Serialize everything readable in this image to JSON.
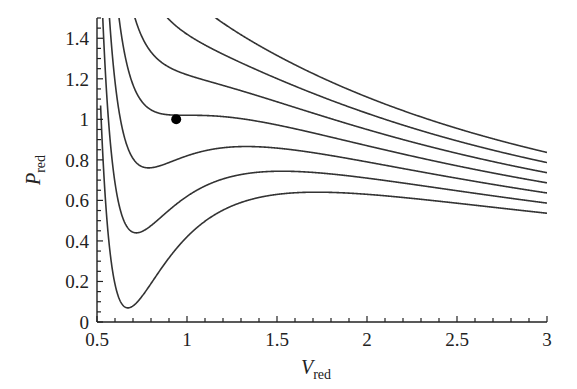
{
  "chart_data": {
    "type": "line",
    "title": "",
    "xlabel": "V",
    "xlabel_sub": "red",
    "ylabel": "P",
    "ylabel_sub": "red",
    "xlim": [
      0.5,
      3
    ],
    "ylim": [
      0,
      1.5
    ],
    "x_ticks": [
      0.5,
      1,
      1.5,
      2,
      2.5,
      3
    ],
    "x_tick_labels": [
      "0.5",
      "1",
      "1.5",
      "2",
      "2.5",
      "3"
    ],
    "x_minor_step": 0.1,
    "y_ticks": [
      0,
      0.2,
      0.4,
      0.6,
      0.8,
      1,
      1.2,
      1.4
    ],
    "y_tick_labels": [
      "0",
      "0.2",
      "0.4",
      "0.6",
      "0.8",
      "1",
      "1.2",
      "1.4"
    ],
    "y_minor_step": 0.05,
    "grid": false,
    "legend": null,
    "model": "van der Waals reduced isotherms: P = 8T/(3V-1) - 3/V^2",
    "series": [
      {
        "name": "T=0.85",
        "T": 0.85,
        "min_point": [
          0.68,
          0.05
        ],
        "value_at_V3": 0.53
      },
      {
        "name": "T=0.90",
        "T": 0.9,
        "min_point": [
          0.71,
          0.42
        ],
        "value_at_V3": 0.58
      },
      {
        "name": "T=0.95",
        "T": 0.95,
        "min_point": [
          0.78,
          0.74
        ],
        "value_at_V3": 0.63
      },
      {
        "name": "T=1.00 (critical)",
        "T": 1.0,
        "value_at_V3": 0.69
      },
      {
        "name": "T=1.05",
        "T": 1.05,
        "value_at_V3": 0.74
      },
      {
        "name": "T=1.10",
        "T": 1.1,
        "value_at_V3": 0.79
      },
      {
        "name": "T=1.15",
        "T": 1.15,
        "value_at_V3": 0.84
      }
    ],
    "annotations": [
      {
        "type": "point",
        "label": "critical point",
        "x": 0.94,
        "y": 1.0,
        "color": "#000000"
      }
    ]
  },
  "colors": {
    "curve": "#333333",
    "axis": "#222222",
    "background": "#ffffff"
  }
}
